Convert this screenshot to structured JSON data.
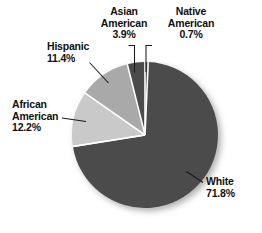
{
  "chart_data": {
    "type": "pie",
    "title": "",
    "subtitle": "",
    "xlabel": "",
    "ylabel": "",
    "legend_position": "none",
    "grid": false,
    "value_unit": "%",
    "categories": [
      "White",
      "African American",
      "Hispanic",
      "Asian American",
      "Native American"
    ],
    "values": [
      71.8,
      12.2,
      11.4,
      3.9,
      0.7
    ],
    "slices": [
      {
        "label": "White",
        "label_line1": "White",
        "label_line2": "",
        "value": 71.8,
        "value_text": "71.8%",
        "color": "#4b4b4b"
      },
      {
        "label": "African American",
        "label_line1": "African",
        "label_line2": "American",
        "value": 12.2,
        "value_text": "12.2%",
        "color": "#c9c9c9"
      },
      {
        "label": "Hispanic",
        "label_line1": "Hispanic",
        "label_line2": "",
        "value": 11.4,
        "value_text": "11.4%",
        "color": "#a9a9a9"
      },
      {
        "label": "Asian American",
        "label_line1": "Asian",
        "label_line2": "American",
        "value": 3.9,
        "value_text": "3.9%",
        "color": "#4b4b4b"
      },
      {
        "label": "Native American",
        "label_line1": "Native",
        "label_line2": "American",
        "value": 0.7,
        "value_text": "0.7%",
        "color": "#4b4b4b"
      }
    ],
    "colors": {
      "slice_dark": "#4b4b4b",
      "slice_mid": "#a9a9a9",
      "slice_light": "#c9c9c9",
      "separator": "#ffffff",
      "leader_line": "#1a1a1a",
      "text": "#101010",
      "background": "#ffffff"
    }
  }
}
